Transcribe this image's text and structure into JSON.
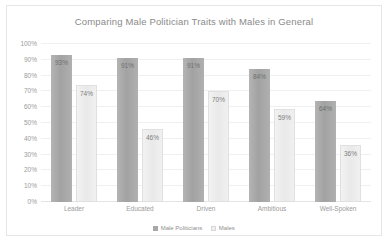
{
  "chart_data": {
    "type": "bar",
    "title": "Comparing Male Politician Traits with Males in General",
    "xlabel": "",
    "ylabel": "",
    "ylim": [
      0,
      100
    ],
    "yticks": [
      "0%",
      "10%",
      "20%",
      "30%",
      "40%",
      "50%",
      "60%",
      "70%",
      "80%",
      "90%",
      "100%"
    ],
    "grid": true,
    "legend_position": "bottom",
    "categories": [
      "Leader",
      "Educated",
      "Driven",
      "Ambitious",
      "Well-Spoken"
    ],
    "series": [
      {
        "name": "Male Politicians",
        "color": "#a8a8a8",
        "values": [
          93,
          91,
          91,
          84,
          64
        ],
        "labels": [
          "93%",
          "91%",
          "91%",
          "84%",
          "64%"
        ]
      },
      {
        "name": "Males",
        "color": "#f0f0f0",
        "values": [
          74,
          46,
          70,
          59,
          36
        ],
        "labels": [
          "74%",
          "46%",
          "70%",
          "59%",
          "36%"
        ]
      }
    ]
  }
}
